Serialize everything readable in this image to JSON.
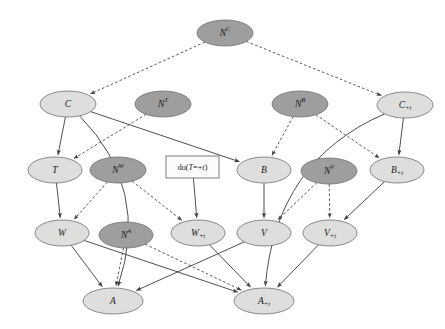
{
  "figure": {
    "type": "causal-dag"
  },
  "colors": {
    "observed_fill": "#dededd",
    "noise_fill": "#9e9e9e",
    "node_stroke": "#6f6f6f",
    "edge": "#3b3b3b",
    "background": "#ffffff",
    "box_fill": "#fbfbfb"
  },
  "nodes": [
    {
      "id": "NC",
      "base": "N",
      "sup": "C",
      "sub": "",
      "label": "N^C",
      "kind": "noise",
      "cx": 225,
      "cy": 33,
      "rx": 28,
      "ry": 13
    },
    {
      "id": "C",
      "base": "C",
      "sup": "",
      "sub": "",
      "label": "C",
      "kind": "observed",
      "cx": 68,
      "cy": 104,
      "rx": 28,
      "ry": 13
    },
    {
      "id": "NT",
      "base": "N",
      "sup": "T",
      "sub": "",
      "label": "N^T",
      "kind": "noise",
      "cx": 163,
      "cy": 104,
      "rx": 28,
      "ry": 13
    },
    {
      "id": "NB",
      "base": "N",
      "sup": "B",
      "sub": "",
      "label": "N^B",
      "kind": "noise",
      "cx": 300,
      "cy": 104,
      "rx": 28,
      "ry": 13
    },
    {
      "id": "Ct",
      "base": "C",
      "sup": "",
      "sub": "+t",
      "label": "C_+t",
      "kind": "observed",
      "cx": 405,
      "cy": 105,
      "rx": 28,
      "ry": 13
    },
    {
      "id": "T",
      "base": "T",
      "sup": "",
      "sub": "",
      "label": "T",
      "kind": "observed",
      "cx": 55,
      "cy": 170,
      "rx": 27,
      "ry": 13
    },
    {
      "id": "NW",
      "base": "N",
      "sup": "W",
      "sub": "",
      "label": "N^W",
      "kind": "noise",
      "cx": 118,
      "cy": 170,
      "rx": 28,
      "ry": 13
    },
    {
      "id": "B",
      "base": "B",
      "sup": "",
      "sub": "",
      "label": "B",
      "kind": "observed",
      "cx": 264,
      "cy": 170,
      "rx": 27,
      "ry": 13
    },
    {
      "id": "NV",
      "base": "N",
      "sup": "V",
      "sub": "",
      "label": "N^V",
      "kind": "noise",
      "cx": 329,
      "cy": 171,
      "rx": 28,
      "ry": 13
    },
    {
      "id": "Bt",
      "base": "B",
      "sup": "",
      "sub": "+t",
      "label": "B_+t",
      "kind": "observed",
      "cx": 397,
      "cy": 170,
      "rx": 27,
      "ry": 13
    },
    {
      "id": "W",
      "base": "W",
      "sup": "",
      "sub": "",
      "label": "W",
      "kind": "observed",
      "cx": 62,
      "cy": 233,
      "rx": 27,
      "ry": 13
    },
    {
      "id": "NA",
      "base": "N",
      "sup": "A",
      "sub": "",
      "label": "N^A",
      "kind": "noise",
      "cx": 126,
      "cy": 235,
      "rx": 27,
      "ry": 13
    },
    {
      "id": "Wt",
      "base": "W",
      "sup": "",
      "sub": "+t",
      "label": "W_+t",
      "kind": "observed",
      "cx": 198,
      "cy": 233,
      "rx": 27,
      "ry": 13
    },
    {
      "id": "V",
      "base": "V",
      "sup": "",
      "sub": "",
      "label": "V",
      "kind": "observed",
      "cx": 264,
      "cy": 233,
      "rx": 27,
      "ry": 13
    },
    {
      "id": "Vt",
      "base": "V",
      "sup": "",
      "sub": "+t",
      "label": "V_+t",
      "kind": "observed",
      "cx": 330,
      "cy": 233,
      "rx": 27,
      "ry": 13
    },
    {
      "id": "A",
      "base": "A",
      "sup": "",
      "sub": "",
      "label": "A",
      "kind": "observed",
      "cx": 113,
      "cy": 301,
      "rx": 30,
      "ry": 13
    },
    {
      "id": "At",
      "base": "A",
      "sup": "",
      "sub": "+t",
      "label": "A_+t",
      "kind": "observed",
      "cx": 264,
      "cy": 301,
      "rx": 30,
      "ry": 13
    }
  ],
  "intervention_box": {
    "id": "do-box",
    "text_prefix": "do(",
    "text_var": "T",
    "text_eq": "=+",
    "text_val": "t",
    "text_suffix": ")",
    "full_text": "do(T=+t)",
    "x": 166,
    "y": 156,
    "w": 53,
    "h": 22
  },
  "edges": [
    {
      "from": "NC",
      "to": "C",
      "style": "dashed"
    },
    {
      "from": "NC",
      "to": "Ct",
      "style": "dashed"
    },
    {
      "from": "NT",
      "to": "T",
      "style": "dashed"
    },
    {
      "from": "C",
      "to": "T",
      "style": "solid"
    },
    {
      "from": "C",
      "to": "B",
      "style": "solid"
    },
    {
      "from": "C",
      "to": "A",
      "style": "solid"
    },
    {
      "from": "NB",
      "to": "B",
      "style": "dashed"
    },
    {
      "from": "NB",
      "to": "Bt",
      "style": "dashed"
    },
    {
      "from": "Ct",
      "to": "Bt",
      "style": "solid"
    },
    {
      "from": "Ct",
      "to": "At",
      "style": "solid"
    },
    {
      "from": "T",
      "to": "W",
      "style": "solid"
    },
    {
      "from": "NW",
      "to": "W",
      "style": "dashed"
    },
    {
      "from": "NW",
      "to": "Wt",
      "style": "dashed"
    },
    {
      "from": "do-box",
      "to": "Wt",
      "style": "solid"
    },
    {
      "from": "B",
      "to": "V",
      "style": "solid"
    },
    {
      "from": "NV",
      "to": "V",
      "style": "dashed"
    },
    {
      "from": "NV",
      "to": "Vt",
      "style": "dashed"
    },
    {
      "from": "Bt",
      "to": "Vt",
      "style": "solid"
    },
    {
      "from": "W",
      "to": "A",
      "style": "solid"
    },
    {
      "from": "W",
      "to": "At",
      "style": "solid"
    },
    {
      "from": "NA",
      "to": "A",
      "style": "dashed"
    },
    {
      "from": "NA",
      "to": "At",
      "style": "dashed"
    },
    {
      "from": "Wt",
      "to": "At",
      "style": "solid"
    },
    {
      "from": "V",
      "to": "A",
      "style": "solid"
    },
    {
      "from": "Vt",
      "to": "At",
      "style": "solid"
    }
  ]
}
